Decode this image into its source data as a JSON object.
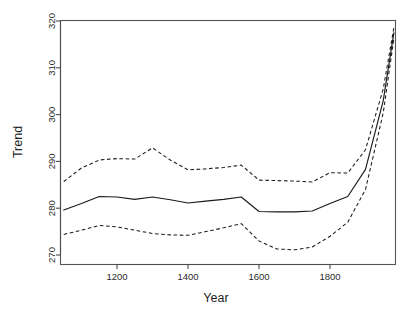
{
  "chart_data": {
    "type": "line",
    "title": "",
    "xlabel": "Year",
    "ylabel": "Trend",
    "xlim": [
      1040,
      1990
    ],
    "ylim": [
      270,
      320
    ],
    "xticks": [
      1200,
      1400,
      1600,
      1800
    ],
    "yticks": [
      270,
      280,
      290,
      300,
      310,
      320
    ],
    "xtick_labels": [
      "1200",
      "1400",
      "1600",
      "1800"
    ],
    "ytick_labels": [
      "270",
      "280",
      "290",
      "300",
      "310",
      "320"
    ],
    "grid": false,
    "legend": "none",
    "x": [
      1050,
      1100,
      1150,
      1200,
      1250,
      1300,
      1350,
      1400,
      1450,
      1500,
      1550,
      1600,
      1650,
      1700,
      1750,
      1800,
      1850,
      1900,
      1950,
      1980
    ],
    "series": [
      {
        "name": "upper-confidence-bound",
        "style": "dashed",
        "values": [
          285.7,
          288.6,
          290.3,
          290.6,
          290.5,
          292.9,
          290.3,
          288.2,
          288.4,
          288.7,
          289.2,
          286.0,
          285.9,
          285.8,
          285.6,
          287.6,
          287.5,
          292.5,
          305.5,
          318.6
        ]
      },
      {
        "name": "trend",
        "style": "solid",
        "values": [
          279.6,
          281.0,
          282.5,
          282.4,
          281.9,
          282.4,
          281.8,
          281.1,
          281.5,
          281.9,
          282.4,
          279.3,
          279.2,
          279.2,
          279.4,
          281.0,
          282.5,
          288.3,
          303.0,
          317.5
        ]
      },
      {
        "name": "lower-confidence-bound",
        "style": "dashed",
        "values": [
          274.4,
          275.3,
          276.3,
          276.0,
          275.3,
          274.6,
          274.3,
          274.2,
          275.0,
          275.8,
          276.7,
          273.0,
          271.3,
          271.1,
          271.7,
          274.0,
          277.0,
          284.0,
          300.4,
          316.3
        ]
      }
    ]
  },
  "axes": {
    "y_title": "Trend",
    "x_title": "Year"
  }
}
